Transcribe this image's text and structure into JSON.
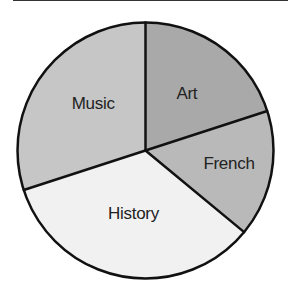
{
  "table_fragment": {
    "columns": 2,
    "visible": "bottom-edge-only"
  },
  "chart_data": {
    "type": "pie",
    "title": "",
    "start_angle": "top (12 o'clock), clockwise",
    "slices": [
      {
        "label": "Art",
        "value": 20,
        "color": "#a9a9a9"
      },
      {
        "label": "French",
        "value": 16,
        "color": "#b9b9b9"
      },
      {
        "label": "History",
        "value": 34,
        "color": "#f1f1f1"
      },
      {
        "label": "Music",
        "value": 30,
        "color": "#c6c6c6"
      }
    ],
    "units": "percent (estimated from slice angles)",
    "legend": "none (labels inside slices)",
    "outline_color": "#111111"
  }
}
